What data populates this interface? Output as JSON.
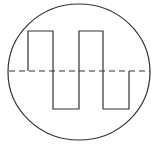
{
  "diagram": {
    "colors": {
      "background": "#ffffff",
      "stroke": "#333333"
    },
    "circle": {
      "cx": 79,
      "cy": 72,
      "rx": 71,
      "ry": 68
    },
    "baseline": {
      "x1": 9,
      "x2": 150,
      "y": 71,
      "dash": "6 4"
    },
    "wave": {
      "points": [
        [
          28,
          71
        ],
        [
          28,
          31
        ],
        [
          53,
          31
        ],
        [
          53,
          109
        ],
        [
          79,
          109
        ],
        [
          79,
          31
        ],
        [
          103,
          31
        ],
        [
          103,
          109
        ],
        [
          129,
          109
        ],
        [
          129,
          71
        ]
      ],
      "high_y": 31,
      "low_y": 109
    }
  }
}
